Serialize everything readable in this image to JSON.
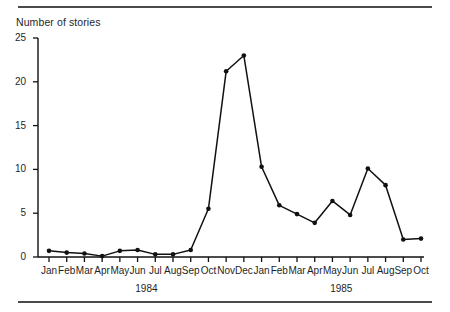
{
  "chart_data": {
    "type": "line",
    "title": "Number of stories",
    "xlabel": "",
    "ylabel": "",
    "ylim": [
      0,
      25
    ],
    "yticks": [
      0,
      5,
      10,
      15,
      20,
      25
    ],
    "grid": false,
    "legend": null,
    "marker": "filled-circle",
    "line_color": "#111111",
    "categories": [
      "Jan",
      "Feb",
      "Mar",
      "Apr",
      "May",
      "Jun",
      "Jul",
      "Aug",
      "Sep",
      "Oct",
      "Nov",
      "Dec",
      "Jan",
      "Feb",
      "Mar",
      "Apr",
      "May",
      "Jun",
      "Jul",
      "Aug",
      "Sep",
      "Oct"
    ],
    "values": [
      0.7,
      0.5,
      0.4,
      0.1,
      0.7,
      0.8,
      0.3,
      0.3,
      0.8,
      5.5,
      21.2,
      23.0,
      10.3,
      5.9,
      4.9,
      3.9,
      6.4,
      4.8,
      10.1,
      8.2,
      2.0,
      2.1
    ],
    "group_labels": [
      {
        "text": "1984",
        "start_index": 0,
        "end_index": 11
      },
      {
        "text": "1985",
        "start_index": 12,
        "end_index": 21
      }
    ]
  }
}
